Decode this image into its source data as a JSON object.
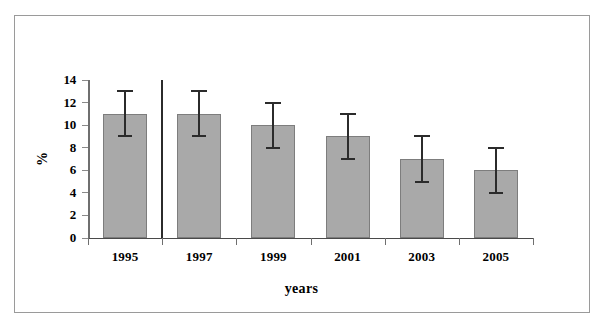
{
  "chart_data": {
    "type": "bar",
    "title": "",
    "subtitle": "",
    "xlabel": "years",
    "ylabel": "%",
    "categories": [
      "1995",
      "1997",
      "1999",
      "2001",
      "2003",
      "2005"
    ],
    "values": [
      11,
      11,
      10,
      9,
      7,
      6
    ],
    "error_upper": [
      13,
      13,
      12,
      11,
      9,
      8
    ],
    "error_lower": [
      9,
      9,
      8,
      7,
      5,
      4
    ],
    "error_plus": [
      2,
      2,
      2,
      2,
      2,
      2
    ],
    "error_minus": [
      2,
      2,
      2,
      2,
      2,
      2
    ],
    "ylim": [
      0,
      14
    ],
    "ytick_values": [
      0,
      2,
      4,
      6,
      8,
      10,
      12,
      14
    ],
    "ytick_labels": [
      "0",
      "2",
      "4",
      "6",
      "8",
      "10",
      "12",
      "14"
    ],
    "ytick_step": 2,
    "grid": false,
    "legend": null,
    "legend_position": "none",
    "annotations": [
      {
        "name": "vertical-divider",
        "description": "vertical separator line between 1995 and 1997 categories",
        "x_between": [
          "1995",
          "1997"
        ],
        "y_from": 0,
        "y_to": 14
      }
    ],
    "series": [
      {
        "name": "percent",
        "values": [
          11,
          11,
          10,
          9,
          7,
          6
        ],
        "bar_color": "#a9a9a9",
        "bar_border_color": "#7d7d7d",
        "error_bar_color": "#2b2b2b"
      }
    ]
  },
  "style": {
    "frame_color": "#9a9a9a",
    "axis_color": "#4a4a4a",
    "background": "#ffffff",
    "text_color": "#000000"
  }
}
